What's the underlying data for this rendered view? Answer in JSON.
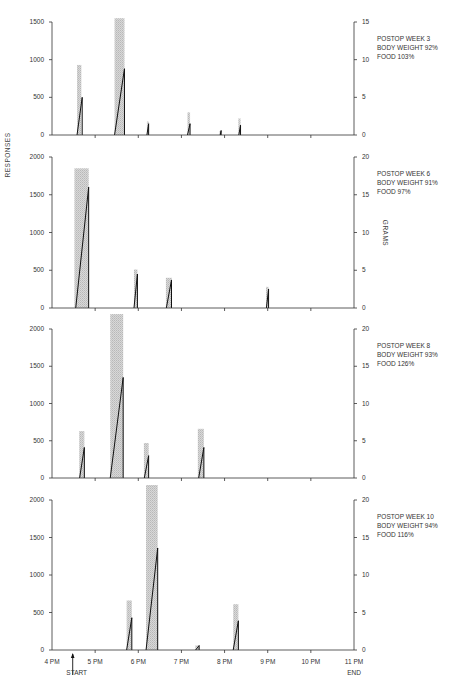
{
  "chart_data": {
    "type": "bar",
    "left_axis_label": "RESPONSES",
    "right_axis_label": "GRAMS",
    "x_ticks": [
      "4 PM",
      "5 PM",
      "6 PM",
      "7 PM",
      "8 PM",
      "9 PM",
      "10 PM",
      "11 PM"
    ],
    "start_label": "START",
    "end_label": "END",
    "panels": [
      {
        "title": "POSTOP WEEK 3",
        "body_weight": "BODY  WEIGHT  92%",
        "food": "FOOD 103%",
        "left_ticks": [
          "0",
          "500",
          "1000",
          "1500"
        ],
        "left_max": 1500,
        "right_ticks": [
          "0",
          "5",
          "10",
          "15"
        ],
        "right_max": 15,
        "bars": [
          {
            "t_start": 4.58,
            "t_end": 4.68,
            "grams": 9.3
          },
          {
            "t_start": 5.45,
            "t_end": 5.68,
            "grams": 15.5
          },
          {
            "t_start": 6.2,
            "t_end": 6.24,
            "grams": 1.8
          },
          {
            "t_start": 7.14,
            "t_end": 7.2,
            "grams": 3.0
          },
          {
            "t_start": 7.88,
            "t_end": 7.92,
            "grams": 0.5
          },
          {
            "t_start": 8.32,
            "t_end": 8.37,
            "grams": 2.2
          }
        ],
        "responses": [
          {
            "t_start": 4.58,
            "t_end": 4.7,
            "peak": 500
          },
          {
            "t_start": 5.45,
            "t_end": 5.68,
            "peak": 880
          },
          {
            "t_start": 6.2,
            "t_end": 6.24,
            "peak": 150
          },
          {
            "t_start": 7.14,
            "t_end": 7.2,
            "peak": 150
          },
          {
            "t_start": 7.9,
            "t_end": 7.92,
            "peak": 60
          },
          {
            "t_start": 8.33,
            "t_end": 8.37,
            "peak": 130
          }
        ]
      },
      {
        "title": "POSTOP WEEK 6",
        "body_weight": "BODY  WEIGHT  91%",
        "food": "FOOD 97%",
        "left_ticks": [
          "0",
          "500",
          "1000",
          "1500",
          "2000"
        ],
        "left_max": 2000,
        "right_ticks": [
          "0",
          "5",
          "10",
          "15",
          "20"
        ],
        "right_max": 20,
        "bars": [
          {
            "t_start": 4.52,
            "t_end": 4.85,
            "grams": 18.5
          },
          {
            "t_start": 5.9,
            "t_end": 5.98,
            "grams": 5.1
          },
          {
            "t_start": 6.64,
            "t_end": 6.78,
            "grams": 4.0
          },
          {
            "t_start": 8.96,
            "t_end": 9.02,
            "grams": 2.8
          }
        ],
        "responses": [
          {
            "t_start": 4.55,
            "t_end": 4.85,
            "peak": 1600
          },
          {
            "t_start": 5.9,
            "t_end": 5.98,
            "peak": 450
          },
          {
            "t_start": 6.65,
            "t_end": 6.77,
            "peak": 370
          },
          {
            "t_start": 8.97,
            "t_end": 9.02,
            "peak": 250
          }
        ]
      },
      {
        "title": "POSTOP WEEK 8",
        "body_weight": "BODY  WEIGHT  93%",
        "food": "126%",
        "food_label": "FOOD 126%",
        "left_ticks": [
          "0",
          "500",
          "1000",
          "1500",
          "2000"
        ],
        "left_max": 2000,
        "right_ticks": [
          "0",
          "5",
          "10",
          "15",
          "20"
        ],
        "right_max": 20,
        "bars": [
          {
            "t_start": 4.63,
            "t_end": 4.75,
            "grams": 6.3
          },
          {
            "t_start": 5.35,
            "t_end": 5.65,
            "grams": 22
          },
          {
            "t_start": 6.13,
            "t_end": 6.24,
            "grams": 4.7
          },
          {
            "t_start": 7.38,
            "t_end": 7.52,
            "grams": 6.6
          }
        ],
        "responses": [
          {
            "t_start": 4.64,
            "t_end": 4.75,
            "peak": 410
          },
          {
            "t_start": 5.35,
            "t_end": 5.65,
            "peak": 1350
          },
          {
            "t_start": 6.14,
            "t_end": 6.24,
            "peak": 300
          },
          {
            "t_start": 7.4,
            "t_end": 7.52,
            "peak": 410
          }
        ]
      },
      {
        "title": "POSTOP WEEK 10",
        "body_weight": "BODY  WEIGHT  94%",
        "food_label": "FOOD 116%",
        "left_ticks": [
          "0",
          "500",
          "1000",
          "1500",
          "2000"
        ],
        "left_max": 2000,
        "right_ticks": [
          "0",
          "5",
          "10",
          "15",
          "20"
        ],
        "right_max": 20,
        "bars": [
          {
            "t_start": 5.73,
            "t_end": 5.85,
            "grams": 6.6
          },
          {
            "t_start": 6.18,
            "t_end": 6.45,
            "grams": 22
          },
          {
            "t_start": 7.32,
            "t_end": 7.42,
            "grams": 0.6
          },
          {
            "t_start": 8.2,
            "t_end": 8.32,
            "grams": 6.1
          }
        ],
        "responses": [
          {
            "t_start": 5.73,
            "t_end": 5.85,
            "peak": 430
          },
          {
            "t_start": 6.18,
            "t_end": 6.45,
            "peak": 1360
          },
          {
            "t_start": 7.33,
            "t_end": 7.41,
            "peak": 60
          },
          {
            "t_start": 8.2,
            "t_end": 8.32,
            "peak": 390
          }
        ]
      }
    ]
  }
}
